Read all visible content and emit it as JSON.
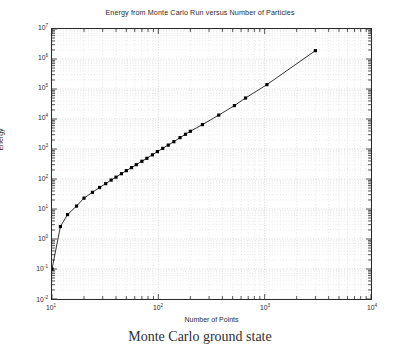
{
  "figure": {
    "title": "Energy from Monte Carlo Run versus Number of Particles",
    "caption": "Monte Carlo ground state",
    "frame_color": "#2a2a2a",
    "grid_color": "#c8c8c8",
    "line_color": "#000000"
  },
  "axes": {
    "x_label": "Number of Points",
    "y_label": "Energy",
    "x_ticks": [
      {
        "label": "10",
        "exp": "1",
        "value": 10
      },
      {
        "label": "10",
        "exp": "2",
        "value": 100
      },
      {
        "label": "10",
        "exp": "3",
        "value": 1000
      },
      {
        "label": "10",
        "exp": "4",
        "value": 10000
      }
    ],
    "y_ticks": [
      {
        "label": "10",
        "exp": "7",
        "value": 10000000
      },
      {
        "label": "10",
        "exp": "6",
        "value": 1000000
      },
      {
        "label": "10",
        "exp": "5",
        "value": 100000
      },
      {
        "label": "10",
        "exp": "4",
        "value": 10000
      },
      {
        "label": "10",
        "exp": "3",
        "value": 1000
      },
      {
        "label": "10",
        "exp": "2",
        "value": 100
      },
      {
        "label": "10",
        "exp": "1",
        "value": 10
      },
      {
        "label": "10",
        "exp": "0",
        "value": 1
      },
      {
        "label": "10",
        "exp": "-1",
        "value": 0.1
      },
      {
        "label": "10",
        "exp": "-2",
        "value": 0.01
      }
    ]
  },
  "chart_data": {
    "type": "line",
    "title": "Energy from Monte Carlo Run versus Number of Particles",
    "subtitle": "Monte Carlo ground state",
    "xlabel": "Number of Points",
    "ylabel": "Energy",
    "xscale": "log",
    "yscale": "log",
    "xlim": [
      10,
      10000
    ],
    "ylim": [
      0.01,
      10000000
    ],
    "grid": true,
    "minor_grid": true,
    "legend": "none",
    "marker": "square",
    "series": [
      {
        "name": "Energy",
        "x": [
          10,
          12,
          14,
          17,
          20,
          24,
          28,
          32,
          36,
          40,
          45,
          50,
          56,
          62,
          70,
          78,
          88,
          98,
          110,
          124,
          140,
          160,
          180,
          200,
          260,
          370,
          520,
          660,
          1050,
          3000
        ],
        "y": [
          0.1,
          2.6,
          6.5,
          12.5,
          23,
          36,
          52,
          70,
          92,
          115,
          150,
          190,
          240,
          300,
          390,
          490,
          640,
          820,
          1050,
          1350,
          1750,
          2400,
          3100,
          3900,
          6500,
          13500,
          28000,
          50000,
          140000,
          1900000
        ]
      }
    ]
  }
}
